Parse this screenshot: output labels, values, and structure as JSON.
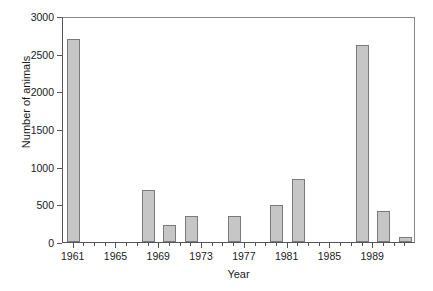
{
  "chart_data": {
    "type": "bar",
    "title": "",
    "xlabel": "Year",
    "ylabel": "Number of animals",
    "categories": [
      1961,
      1968,
      1970,
      1972,
      1976,
      1980,
      1982,
      1988,
      1990,
      1992
    ],
    "values": [
      2690,
      690,
      230,
      345,
      345,
      490,
      830,
      2610,
      410,
      60
    ],
    "series": [
      {
        "name": "Number of animals",
        "values": [
          2690,
          690,
          230,
          345,
          345,
          490,
          830,
          2610,
          410,
          60
        ]
      }
    ],
    "xlim": [
      1960,
      1993
    ],
    "ylim": [
      0,
      3000
    ],
    "ytick_labels": [
      "0",
      "500",
      "1000",
      "1500",
      "2000",
      "2500",
      "3000"
    ],
    "ytick_values": [
      0,
      500,
      1000,
      1500,
      2000,
      2500,
      3000
    ],
    "xtick_labels": [
      "1961",
      "1965",
      "1969",
      "1973",
      "1977",
      "1981",
      "1985",
      "1989"
    ],
    "xtick_values": [
      1961,
      1965,
      1969,
      1973,
      1977,
      1981,
      1985,
      1989
    ],
    "xtick_minor_values": [
      1962,
      1963,
      1964,
      1966,
      1967,
      1968,
      1970,
      1971,
      1972,
      1974,
      1975,
      1976,
      1978,
      1979,
      1980,
      1982,
      1983,
      1984,
      1986,
      1987,
      1988,
      1990,
      1991,
      1992
    ],
    "grid": false,
    "legend": false,
    "legend_position": "none",
    "bar_fill_color": "#c6c6c6",
    "bar_border_color": "#7a7a7a",
    "axis_color": "#555555",
    "text_color": "#1a1a1a",
    "background_color": "#ffffff"
  }
}
